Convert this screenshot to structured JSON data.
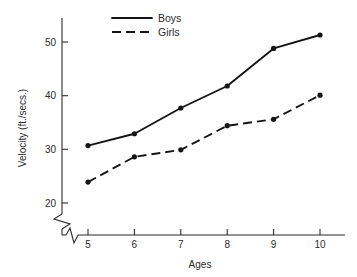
{
  "chart_data": {
    "type": "line",
    "title": "",
    "xlabel": "Ages",
    "ylabel": "Velocity (ft./secs.)",
    "x": [
      5,
      6,
      7,
      8,
      9,
      10
    ],
    "xtick_labels": [
      "5",
      "6",
      "7",
      "8",
      "9",
      "10"
    ],
    "ytick_labels": [
      "20",
      "30",
      "40",
      "50"
    ],
    "ytick_values": [
      20,
      30,
      40,
      50
    ],
    "xlim": [
      4.6,
      10.6
    ],
    "ylim": [
      18.5,
      52.5
    ],
    "grid": false,
    "legend_position": "top-center",
    "axis_break_y": true,
    "axis_break_x": true,
    "series": [
      {
        "name": "Boys",
        "style": "solid",
        "values": [
          30.7,
          32.9,
          37.7,
          41.8,
          48.8,
          51.3
        ]
      },
      {
        "name": "Girls",
        "style": "dashed",
        "values": [
          23.9,
          28.6,
          29.9,
          34.4,
          35.6,
          40.1
        ]
      }
    ]
  },
  "legend": {
    "entries": [
      {
        "label": "Boys"
      },
      {
        "label": "Girls"
      }
    ]
  },
  "colors": {
    "ink": "#151515",
    "axis": "#2b2b2b",
    "background": "#ffffff"
  }
}
